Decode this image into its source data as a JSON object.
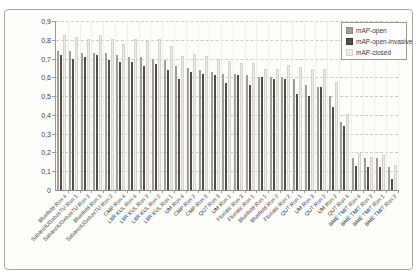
{
  "figure": {
    "background": "#ffffff",
    "frame_border": "#a8a8a0",
    "gridline_color": "#ccccc5",
    "text_color": "#404040"
  },
  "chart_data": {
    "type": "bar",
    "title": "",
    "xlabel": "",
    "ylabel": "",
    "ylim": [
      0,
      0.9
    ],
    "grid": "horizontal-dashed",
    "legend_position": "top-right",
    "ytick_values": [
      0,
      0.1,
      0.2,
      0.3,
      0.4,
      0.5,
      0.6,
      0.7,
      0.8,
      0.9
    ],
    "ytick_labels": [
      "0",
      "0,1",
      "0,2",
      "0,3",
      "0,4",
      "0,5",
      "0,6",
      "0,7",
      "0,8",
      "0,9"
    ],
    "categories": [
      "Bluefield Run 4",
      "SabanciUGebzeTU Run 1",
      "SabanciUGebzeTU Run 3",
      "Bluefield Run 3",
      "SabanciUGebzeTU Run 2",
      "CMP Run 4",
      "LIIR KUL Run 4",
      "LIIR KUL Run 3",
      "LIIR KUL Run 2",
      "LIIR KUL Run 1",
      "UM Run 4",
      "CMP Run 2",
      "CMP Run 3",
      "QUT Run 3",
      "UM Run 1",
      "Floristic Run 3",
      "Floristic Run 1",
      "Bluefield Run 1",
      "Bluefield Run 2",
      "Floristic Run 2",
      "QUT Run 1",
      "UM Run 3",
      "QUT Run 2",
      "UM Run 2",
      "QUT Run 4",
      "BME TMIT Run 4",
      "BME TMIT Run 3",
      "BME TMIT Run 1",
      "BME TMIT Run 2"
    ],
    "series": [
      {
        "name": "mAP-open",
        "color": "#a29e98",
        "border": "#8d8983",
        "values": [
          0.74,
          0.74,
          0.73,
          0.73,
          0.73,
          0.72,
          0.71,
          0.71,
          0.7,
          0.69,
          0.66,
          0.65,
          0.64,
          0.63,
          0.62,
          0.62,
          0.61,
          0.6,
          0.6,
          0.6,
          0.59,
          0.56,
          0.55,
          0.5,
          0.36,
          0.17,
          0.17,
          0.17,
          0.12
        ]
      },
      {
        "name": "mAP-open-invasive",
        "color": "#514e49",
        "border": "#3c3936",
        "values": [
          0.72,
          0.7,
          0.71,
          0.72,
          0.69,
          0.68,
          0.68,
          0.66,
          0.67,
          0.64,
          0.59,
          0.63,
          0.62,
          0.61,
          0.57,
          0.61,
          0.56,
          0.6,
          0.59,
          0.59,
          0.51,
          0.5,
          0.55,
          0.44,
          0.34,
          0.13,
          0.12,
          0.12,
          0.06
        ]
      },
      {
        "name": "mAP-closed",
        "color": "#edebe5",
        "border": "#d5d3cc",
        "values": [
          0.82,
          0.81,
          0.8,
          0.82,
          0.8,
          0.77,
          0.8,
          0.79,
          0.8,
          0.76,
          0.71,
          0.72,
          0.71,
          0.69,
          0.68,
          0.67,
          0.67,
          0.64,
          0.64,
          0.66,
          0.65,
          0.64,
          0.64,
          0.57,
          0.4,
          0.19,
          0.17,
          0.18,
          0.13
        ]
      }
    ]
  }
}
